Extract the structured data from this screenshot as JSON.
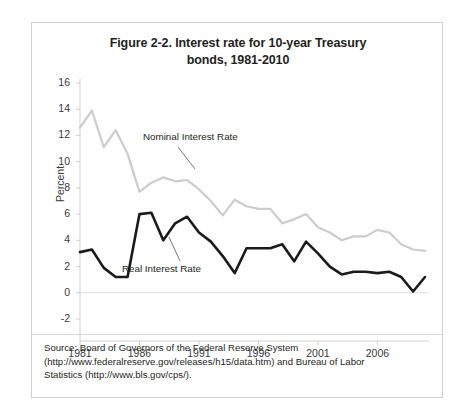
{
  "figure": {
    "title": "Figure 2-2. Interest rate for 10-year Treasury bonds, 1981-2010",
    "title_line1": "Figure 2-2. Interest rate for 10-year Treasury",
    "title_line2": "bonds, 1981-2010",
    "source_line1": "Source: Board of Governors of the Federal Reserve System",
    "source_line2": "(http://www.federalreserve.gov/releases/h15/data.htm) and Bureau of Labor",
    "source_line3": "Statistics (http://www.bls.gov/cps/).",
    "source_full": "Source: Board of Governors of the Federal Reserve System (http://www.federalreserve.gov/releases/h15/data.htm) and Bureau of Labor Statistics (http://www.bls.gov/cps/)."
  },
  "annotations": {
    "nominal_label": "Nominal Interest Rate",
    "real_label": "Real Interest Rate"
  },
  "colors": {
    "nominal_line": "#cccccc",
    "real_line": "#1a1a1a",
    "axis": "#d0d0d0",
    "text": "#231f20",
    "frame": "#d0d0d0"
  },
  "chart_data": {
    "type": "line",
    "title": "Figure 2-2. Interest rate for 10-year Treasury bonds, 1981-2010",
    "xlabel": "",
    "ylabel": "Percent",
    "xlim": [
      1981,
      2010
    ],
    "ylim": [
      -2,
      16
    ],
    "yticks": [
      16,
      14,
      12,
      10,
      8,
      6,
      4,
      2,
      0,
      -2
    ],
    "xticks": [
      1981,
      1986,
      1991,
      1996,
      2001,
      2006
    ],
    "grid": false,
    "legend": "inline-annotations",
    "x": [
      1981,
      1982,
      1983,
      1984,
      1985,
      1986,
      1987,
      1988,
      1989,
      1990,
      1991,
      1992,
      1993,
      1994,
      1995,
      1996,
      1997,
      1998,
      1999,
      2000,
      2001,
      2002,
      2003,
      2004,
      2005,
      2006,
      2007,
      2008,
      2009,
      2010
    ],
    "series": [
      {
        "name": "Nominal Interest Rate",
        "color": "#cccccc",
        "values": [
          12.6,
          13.9,
          11.1,
          12.4,
          10.6,
          7.7,
          8.4,
          8.8,
          8.5,
          8.6,
          7.9,
          7.0,
          5.9,
          7.1,
          6.6,
          6.4,
          6.4,
          5.3,
          5.6,
          6.0,
          5.0,
          4.6,
          4.0,
          4.3,
          4.3,
          4.8,
          4.6,
          3.7,
          3.3,
          3.2
        ]
      },
      {
        "name": "Real Interest Rate",
        "color": "#1a1a1a",
        "values": [
          3.1,
          3.3,
          1.9,
          1.2,
          1.2,
          6.0,
          6.1,
          4.0,
          5.3,
          5.8,
          4.6,
          3.9,
          2.8,
          1.5,
          3.4,
          3.4,
          3.4,
          3.7,
          2.4,
          3.9,
          3.0,
          2.0,
          1.4,
          1.6,
          1.6,
          1.5,
          1.6,
          1.2,
          0.1,
          1.2
        ]
      }
    ],
    "annotations": [
      {
        "text": "Nominal Interest Rate",
        "x": 1988,
        "y": 9.8
      },
      {
        "text": "Real Interest Rate",
        "x": 1991,
        "y": 1.7
      }
    ]
  }
}
